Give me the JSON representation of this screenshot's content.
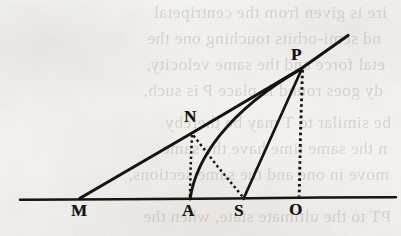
{
  "page": {
    "kind": "scanned-book-page-figure",
    "width": 401,
    "height": 236,
    "paper_color": "#f7f6f4",
    "ink_color": "#16120e",
    "ghost_ink_color": "#4a4238"
  },
  "figure": {
    "caption": "",
    "baseline": {
      "name": "MO-baseline",
      "x1": 20,
      "y1": 199.5,
      "x2": 396,
      "y2": 197.5
    },
    "points": [
      {
        "id": "M",
        "label": "M",
        "x": 79,
        "y": 198,
        "label_x": 71,
        "label_y": 202
      },
      {
        "id": "A",
        "label": "A",
        "x": 190,
        "y": 199,
        "label_x": 182,
        "label_y": 202
      },
      {
        "id": "S",
        "label": "S",
        "x": 243,
        "y": 199,
        "label_x": 234,
        "label_y": 202
      },
      {
        "id": "O",
        "label": "O",
        "x": 299,
        "y": 198,
        "label_x": 289,
        "label_y": 201
      },
      {
        "id": "N",
        "label": "N",
        "x": 192,
        "y": 133,
        "label_x": 184,
        "label_y": 108
      },
      {
        "id": "P",
        "label": "P",
        "x": 302,
        "y": 68,
        "label_x": 291,
        "label_y": 46
      }
    ],
    "solid_lines": [
      {
        "name": "baseline-MO",
        "from": "M-left-edge",
        "to": "O-right-edge"
      },
      {
        "name": "ray-M-through-N-to-P-extended",
        "from": "M",
        "to": "beyond-P"
      },
      {
        "name": "chord-S-to-P",
        "from": "S",
        "to": "P"
      }
    ],
    "solid_curves": [
      {
        "name": "curve-A-to-P",
        "from": "A",
        "to": "P"
      }
    ],
    "dotted_lines": [
      {
        "name": "ordinate-P-to-O",
        "from": "P",
        "to": "O"
      },
      {
        "name": "ordinate-N-to-A",
        "from": "N",
        "to": "A"
      },
      {
        "name": "chord-N-to-S",
        "from": "N",
        "to": "S"
      }
    ]
  },
  "ghost_text": {
    "description": "faint mirrored show-through of the text printed on the reverse side of the leaf",
    "lines": [
      {
        "text": "ire is given from the centripetal",
        "x": 14,
        "y": 2,
        "size": 17.5
      },
      {
        "text": "nd semi-orbits touching one the",
        "x": 20,
        "y": 28,
        "size": 17.5
      },
      {
        "text": "etal force and the same velocity,",
        "x": 16,
        "y": 54,
        "size": 17.5
      },
      {
        "text": "dy goes round is place P is such,",
        "x": 18,
        "y": 80,
        "size": 17.5
      },
      {
        "text": "be similar to T may be thereby",
        "x": 10,
        "y": 112,
        "size": 17.5
      },
      {
        "text": "n the same time have the same",
        "x": 14,
        "y": 138,
        "size": 17.5
      },
      {
        "text": "move in one and the same sections,",
        "x": 12,
        "y": 164,
        "size": 17.5
      },
      {
        "text": "PT to the ultimate state, when the",
        "x": 10,
        "y": 206,
        "size": 17.5
      }
    ]
  }
}
